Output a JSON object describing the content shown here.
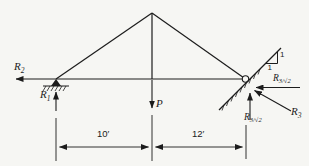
{
  "figure": {
    "ink_color": "#1c1c1c",
    "paper_color": "#f6f6f3"
  },
  "labels": {
    "r2": {
      "main": "R",
      "sub": "2"
    },
    "r1": {
      "main": "R",
      "sub": "1"
    },
    "load_p": {
      "main": "P"
    },
    "r3_sqrt2_side": {
      "main": "R",
      "sub": "3/√2"
    },
    "r3_sqrt2_bottom": {
      "main": "R",
      "sub": "3/√2"
    },
    "r3": {
      "main": "R",
      "sub": "3"
    },
    "slope_rise": "1",
    "slope_run": "1",
    "dim_left_span": "10′",
    "dim_right_span": "12′"
  }
}
